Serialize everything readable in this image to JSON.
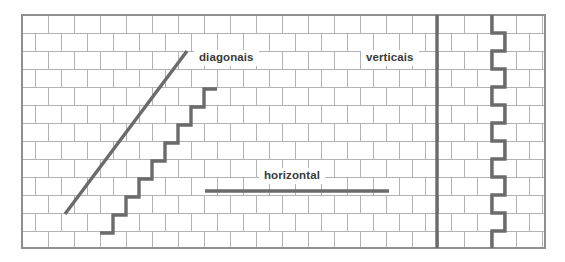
{
  "figure": {
    "width": 565,
    "height": 262,
    "background_color": "#ffffff"
  },
  "wall": {
    "name": "brick-wall",
    "bond_pattern": "running-bond",
    "origin_x": 22,
    "origin_y": 15,
    "wall_width": 523,
    "wall_height": 233,
    "brick_width": 26,
    "brick_height": 18,
    "row_count": 13,
    "mortar_color": "#b3b3b3",
    "brick_fill": "#ffffff",
    "outline_color": "#8f8f8f",
    "mortar_line_width": 1
  },
  "labels": {
    "diagonais": "diagonais",
    "verticais": "verticais",
    "horizontal": "horizontal"
  },
  "crack_style": {
    "color": "#6b6b6b",
    "stroke_width": 3.4,
    "linecap": "butt",
    "linejoin": "miter"
  },
  "cracks": [
    {
      "id": "diagonal-straight-crack",
      "name": "diagonal-straight-crack",
      "type": "diagonal",
      "label": "diagonais",
      "points": [
        [
          65,
          214
        ],
        [
          187,
          51
        ]
      ]
    },
    {
      "id": "diagonal-stepped-crack",
      "name": "diagonal-stepped-crack",
      "type": "stepped-diagonal",
      "label": "diagonais",
      "points": [
        [
          100,
          233
        ],
        [
          113,
          233
        ],
        [
          113,
          215
        ],
        [
          126,
          215
        ],
        [
          126,
          197
        ],
        [
          139,
          197
        ],
        [
          139,
          179
        ],
        [
          152,
          179
        ],
        [
          152,
          161
        ],
        [
          165,
          161
        ],
        [
          165,
          143
        ],
        [
          178,
          143
        ],
        [
          178,
          125
        ],
        [
          191,
          125
        ],
        [
          191,
          107
        ],
        [
          204,
          107
        ],
        [
          204,
          89
        ],
        [
          217,
          89
        ]
      ]
    },
    {
      "id": "horizontal-crack",
      "name": "horizontal-crack",
      "type": "horizontal",
      "label": "horizontal",
      "points": [
        [
          205,
          191
        ],
        [
          389,
          191
        ]
      ]
    },
    {
      "id": "vertical-straight-crack",
      "name": "vertical-straight-crack",
      "type": "vertical",
      "label": "verticais",
      "points": [
        [
          437,
          15
        ],
        [
          437,
          248
        ]
      ]
    },
    {
      "id": "vertical-toothed-crack",
      "name": "vertical-toothed-crack",
      "type": "vertical-stepped",
      "label": "verticais",
      "points": [
        [
          492,
          15
        ],
        [
          492,
          33
        ],
        [
          505,
          33
        ],
        [
          505,
          51
        ],
        [
          492,
          51
        ],
        [
          492,
          69
        ],
        [
          505,
          69
        ],
        [
          505,
          87
        ],
        [
          492,
          87
        ],
        [
          492,
          105
        ],
        [
          505,
          105
        ],
        [
          505,
          123
        ],
        [
          492,
          123
        ],
        [
          492,
          141
        ],
        [
          505,
          141
        ],
        [
          505,
          159
        ],
        [
          492,
          159
        ],
        [
          492,
          177
        ],
        [
          505,
          177
        ],
        [
          505,
          195
        ],
        [
          492,
          195
        ],
        [
          492,
          213
        ],
        [
          505,
          213
        ],
        [
          505,
          231
        ],
        [
          492,
          231
        ],
        [
          492,
          248
        ]
      ]
    }
  ]
}
